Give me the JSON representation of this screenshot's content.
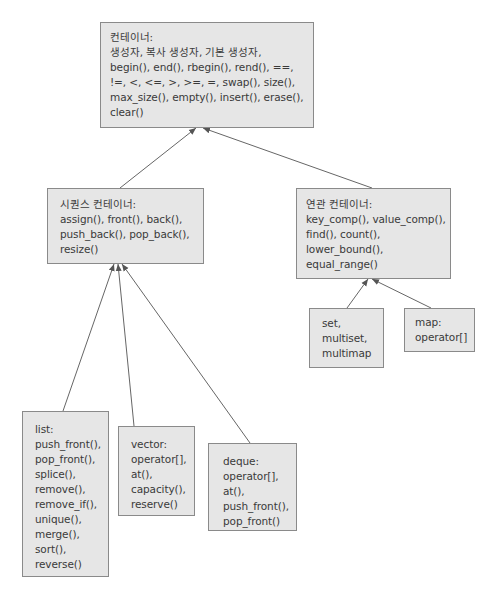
{
  "container": {
    "title": "컨테이너:",
    "lines": [
      "생성자, 복사 생성자, 기본 생성자,",
      "begin(), end(), rbegin(), rend(), ==,",
      "!=, <, <=, >, >=, =, swap(), size(),",
      "max_size(), empty(), insert(), erase(),",
      "clear()"
    ]
  },
  "sequence": {
    "title": "시퀀스 컨테이너:",
    "lines": [
      "assign(), front(), back(),",
      "push_back(), pop_back(),",
      "resize()"
    ]
  },
  "associative": {
    "title": "연관 컨테이너:",
    "lines": [
      "key_comp(), value_comp(),",
      "find(), count(),",
      "lower_bound(),",
      "equal_range()"
    ]
  },
  "set_group": {
    "lines": [
      "set,",
      "multiset,",
      "multimap"
    ]
  },
  "map": {
    "title": "map:",
    "lines": [
      "operator[]"
    ]
  },
  "list": {
    "title": "list:",
    "lines": [
      "push_front(),",
      "pop_front(),",
      "splice(),",
      "remove(),",
      "remove_if(),",
      "unique(),",
      "merge(),",
      "sort(),",
      "reverse()"
    ]
  },
  "vector": {
    "title": "vector:",
    "lines": [
      "operator[],",
      "at(),",
      "capacity(),",
      "reserve()"
    ]
  },
  "deque": {
    "title": "deque:",
    "lines": [
      "operator[],",
      "at(),",
      "push_front(),",
      "pop_front()"
    ]
  },
  "colors": {
    "box_fill": "#e6e6e6",
    "box_border": "#8a8a8a",
    "arrow": "#555555",
    "text": "#3a3a3a"
  }
}
